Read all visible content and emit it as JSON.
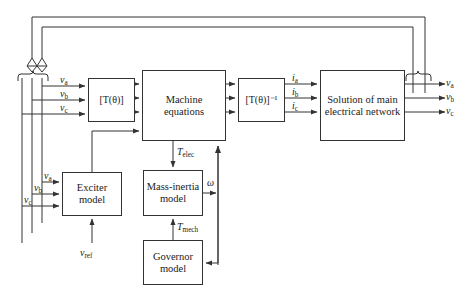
{
  "diagram": {
    "stroke_color": "#333333",
    "background_color": "#ffffff",
    "blocks": [
      {
        "id": "park",
        "label": "[T(θ)]",
        "x": 88,
        "y": 78,
        "w": 47,
        "h": 44
      },
      {
        "id": "machine",
        "label": "Machine equations",
        "x": 142,
        "y": 70,
        "w": 84,
        "h": 71
      },
      {
        "id": "park_inv",
        "label": "[T(θ)]⁻¹",
        "x": 238,
        "y": 78,
        "w": 47,
        "h": 44
      },
      {
        "id": "network",
        "label": "Solution of main electrical network",
        "x": 320,
        "y": 70,
        "w": 85,
        "h": 71
      },
      {
        "id": "exciter",
        "label": "Exciter model",
        "x": 62,
        "y": 172,
        "w": 60,
        "h": 44
      },
      {
        "id": "mass",
        "label": "Mass-inertia model",
        "x": 143,
        "y": 170,
        "w": 60,
        "h": 46
      },
      {
        "id": "governor",
        "label": "Governor model",
        "x": 143,
        "y": 240,
        "w": 60,
        "h": 45
      }
    ],
    "signal_labels": {
      "va_in": "v",
      "va_in_sub": "a",
      "vb_in": "v",
      "vb_in_sub": "b",
      "vc_in": "v",
      "vc_in_sub": "c",
      "va_exc": "v",
      "va_exc_sub": "a",
      "vb_exc": "v",
      "vb_exc_sub": "b",
      "vc_exc": "v",
      "vc_exc_sub": "c",
      "ia": "i",
      "ia_sub": "a",
      "ib": "i",
      "ib_sub": "b",
      "ic": "i",
      "ic_sub": "c",
      "va_out": "v",
      "va_out_sub": "a",
      "vb_out": "v",
      "vb_out_sub": "b",
      "vc_out": "v",
      "vc_out_sub": "c",
      "t_elec": "T",
      "t_elec_sub": "elec",
      "t_mech": "T",
      "t_mech_sub": "mech",
      "omega": "ω",
      "v_ref": "v",
      "v_ref_sub": "ref"
    }
  }
}
